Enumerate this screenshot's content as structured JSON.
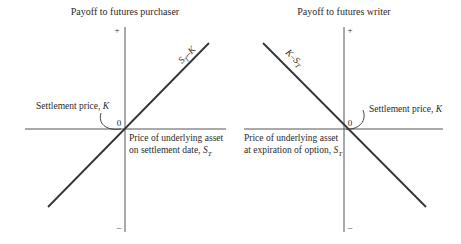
{
  "left_panel": {
    "title": "Payoff to futures purchaser",
    "plus_sign": "+",
    "minus_sign": "–",
    "origin_label": "0",
    "settlement_label_text": "Settlement price, ",
    "settlement_label_var": "K",
    "line_label_main": "S",
    "line_label_sub": "T",
    "line_label_rest": "–K",
    "x_axis_label_line1": "Price of underlying asset",
    "x_axis_label_line2_text": "on settlement date, ",
    "x_axis_label_line2_var": "S",
    "x_axis_label_line2_sub": "T"
  },
  "right_panel": {
    "title": "Payoff to futures writer",
    "plus_sign": "+",
    "minus_sign": "–",
    "origin_label": "0",
    "settlement_label_text": "Settlement price, ",
    "settlement_label_var": "K",
    "line_label_main": "K–S",
    "line_label_sub": "T",
    "x_axis_label_line1": "Price of underlying asset",
    "x_axis_label_line2_text": "at expiration of option, ",
    "x_axis_label_line2_var": "S",
    "x_axis_label_line2_sub": "T"
  },
  "colors": {
    "line": "#333333",
    "axis": "#555555",
    "text": "#2a2a2a",
    "background": "#ffffff"
  }
}
